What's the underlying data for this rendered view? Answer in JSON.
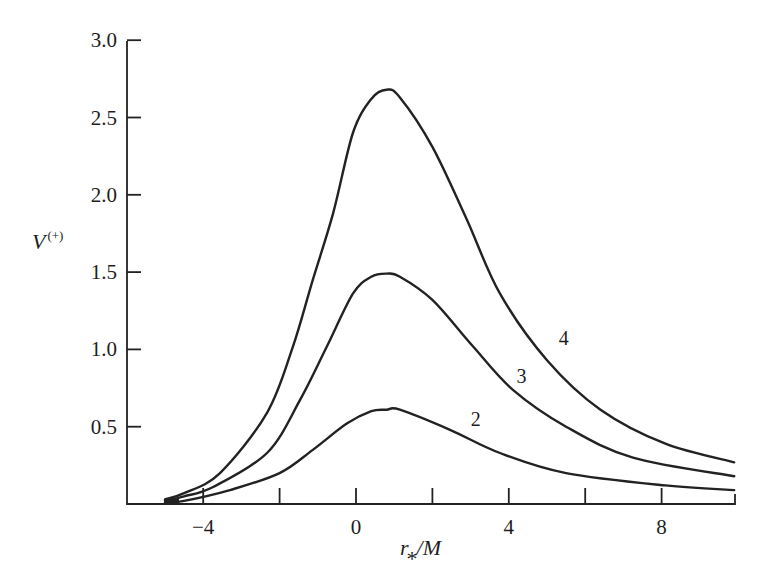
{
  "chart_data": {
    "type": "line",
    "title": "",
    "xlabel": "r_*/M",
    "ylabel": "V^(+)",
    "xlim": [
      -6,
      10
    ],
    "ylim": [
      0,
      3.0
    ],
    "grid": false,
    "legend": "inline curve labels",
    "x_ticks": [
      -4,
      -2,
      0,
      2,
      4,
      6,
      8,
      10
    ],
    "x_tick_labels": [
      {
        "value": -4,
        "label": "−4"
      },
      {
        "value": 0,
        "label": "0"
      },
      {
        "value": 4,
        "label": "4"
      },
      {
        "value": 8,
        "label": "8"
      }
    ],
    "y_ticks": [
      0.5,
      1.0,
      1.5,
      2.0,
      2.5,
      3.0
    ],
    "y_tick_labels": [
      "0.5",
      "1.0",
      "1.5",
      "2.0",
      "2.5",
      "3.0"
    ],
    "series": [
      {
        "name": "4",
        "label": "4",
        "label_pos": {
          "x": 5.2,
          "y": 1.0
        },
        "points": [
          [
            -5.0,
            0.03
          ],
          [
            -4.5,
            0.07
          ],
          [
            -3.56,
            0.2
          ],
          [
            -2.33,
            0.59
          ],
          [
            -1.65,
            1.02
          ],
          [
            -1.13,
            1.45
          ],
          [
            -0.6,
            1.88
          ],
          [
            -0.08,
            2.4
          ],
          [
            0.4,
            2.62
          ],
          [
            0.8,
            2.68
          ],
          [
            1.15,
            2.63
          ],
          [
            2.0,
            2.31
          ],
          [
            2.9,
            1.84
          ],
          [
            3.77,
            1.36
          ],
          [
            5.0,
            0.93
          ],
          [
            6.4,
            0.61
          ],
          [
            8.1,
            0.39
          ],
          [
            9.9,
            0.27
          ]
        ]
      },
      {
        "name": "3",
        "label": "3",
        "label_pos": {
          "x": 4.1,
          "y": 0.76
        },
        "points": [
          [
            -5.0,
            0.02
          ],
          [
            -4.5,
            0.05
          ],
          [
            -3.74,
            0.11
          ],
          [
            -2.33,
            0.33
          ],
          [
            -1.47,
            0.67
          ],
          [
            -0.76,
            1.02
          ],
          [
            -0.08,
            1.36
          ],
          [
            0.4,
            1.47
          ],
          [
            0.8,
            1.49
          ],
          [
            1.15,
            1.47
          ],
          [
            2.0,
            1.32
          ],
          [
            3.06,
            1.02
          ],
          [
            4.1,
            0.74
          ],
          [
            5.5,
            0.5
          ],
          [
            7.25,
            0.3
          ],
          [
            9.9,
            0.18
          ]
        ]
      },
      {
        "name": "2",
        "label": "2",
        "label_pos": {
          "x": 2.9,
          "y": 0.48
        },
        "points": [
          [
            -5.0,
            0.01
          ],
          [
            -4.5,
            0.02
          ],
          [
            -3.3,
            0.09
          ],
          [
            -2.0,
            0.2
          ],
          [
            -1.13,
            0.35
          ],
          [
            -0.24,
            0.52
          ],
          [
            0.4,
            0.6
          ],
          [
            0.8,
            0.61
          ],
          [
            1.15,
            0.61
          ],
          [
            2.46,
            0.48
          ],
          [
            3.77,
            0.33
          ],
          [
            5.5,
            0.2
          ],
          [
            8.1,
            0.12
          ],
          [
            9.9,
            0.09
          ]
        ]
      }
    ]
  },
  "labels": {
    "y_axis_main": "V",
    "y_axis_sup": "(+)",
    "x_axis_r": "r",
    "x_axis_sub": "*",
    "x_axis_rest": "/M"
  }
}
